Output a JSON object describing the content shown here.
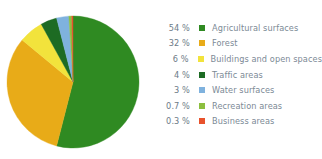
{
  "chart_data": {
    "type": "pie",
    "title": "",
    "legend_position": "right",
    "categories": [
      "Agricultural surfaces",
      "Forest",
      "Buildings and open spaces",
      "Traffic areas",
      "Water surfaces",
      "Recreation areas",
      "Business areas"
    ],
    "values": [
      54,
      32,
      6,
      4,
      3,
      0.7,
      0.3
    ],
    "value_labels": [
      "54 %",
      "32 %",
      "6 %",
      "4 %",
      "3 %",
      "0.7 %",
      "0.3 %"
    ],
    "unit": "%",
    "colors": [
      "#2f8a22",
      "#e8ab18",
      "#f2e33c",
      "#1d6b23",
      "#7fb2de",
      "#8cbf3f",
      "#e8522c"
    ],
    "slices": [
      {
        "label": "Agricultural surfaces",
        "value": 54,
        "value_label": "54 %",
        "color": "#2f8a22"
      },
      {
        "label": "Forest",
        "value": 32,
        "value_label": "32 %",
        "color": "#e8ab18"
      },
      {
        "label": "Buildings and open spaces",
        "value": 6,
        "value_label": "6 %",
        "color": "#f2e33c"
      },
      {
        "label": "Traffic areas",
        "value": 4,
        "value_label": "4 %",
        "color": "#1d6b23"
      },
      {
        "label": "Water surfaces",
        "value": 3,
        "value_label": "3 %",
        "color": "#7fb2de"
      },
      {
        "label": "Recreation areas",
        "value": 0.7,
        "value_label": "0.7 %",
        "color": "#8cbf3f"
      },
      {
        "label": "Business areas",
        "value": 0.3,
        "value_label": "0.3 %",
        "color": "#e8522c"
      }
    ]
  },
  "legend": {
    "rows": [
      {
        "pct": "54 %",
        "label": "Agricultural surfaces",
        "color": "#2f8a22"
      },
      {
        "pct": "32 %",
        "label": "Forest",
        "color": "#e8ab18"
      },
      {
        "pct": "6 %",
        "label": "Buildings and open spaces",
        "color": "#f2e33c"
      },
      {
        "pct": "4 %",
        "label": "Traffic areas",
        "color": "#1d6b23"
      },
      {
        "pct": "3 %",
        "label": "Water surfaces",
        "color": "#7fb2de"
      },
      {
        "pct": "0.7 %",
        "label": "Recreation areas",
        "color": "#8cbf3f"
      },
      {
        "pct": "0.3 %",
        "label": "Business areas",
        "color": "#e8522c"
      }
    ]
  }
}
